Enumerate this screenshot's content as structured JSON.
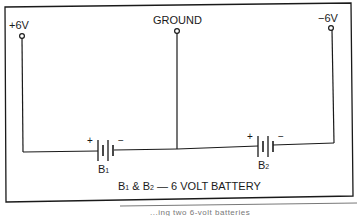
{
  "diagram": {
    "terminals": [
      {
        "id": "positive",
        "label": "+6V"
      },
      {
        "id": "ground",
        "label": "GROUND"
      },
      {
        "id": "negative",
        "label": "−6V"
      }
    ],
    "batteries": [
      {
        "id": "b1",
        "label": "B",
        "subscript": "1",
        "plus": "+",
        "minus": "−"
      },
      {
        "id": "b2",
        "label": "B",
        "subscript": "2",
        "plus": "+",
        "minus": "−"
      }
    ],
    "legend": {
      "b1": "B",
      "b1_sub": "1",
      "amp": " & ",
      "b2": "B",
      "b2_sub": "2",
      "text": " — 6 VOLT BATTERY"
    },
    "caption_fragment": "...ing two 6-volt batteries"
  },
  "colors": {
    "line": "#1a1a1a",
    "background": "#ffffff"
  }
}
